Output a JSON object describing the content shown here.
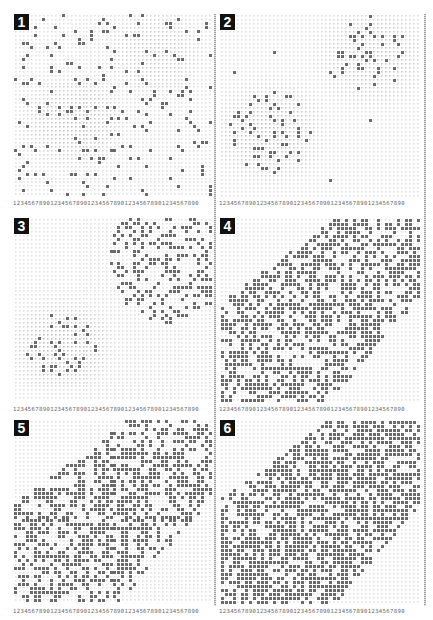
{
  "figure": {
    "grid_columns": 50,
    "column_ruler": "12345678901234567890123456789012345678901234567890",
    "colors": {
      "background": "#ffffff",
      "grid_dot": "#d8d8d8",
      "occupied_dot": "#6a6a6a",
      "blob_shade": "#cfcfcf",
      "badge_bg": "#111111",
      "badge_fg": "#ffffff"
    },
    "panels": [
      {
        "label": "1",
        "x": 14,
        "y": 14,
        "w": 198,
        "h": 186,
        "blobs": [
          {
            "cx": 0.3,
            "cy": 0.6,
            "r": 0.2,
            "shade": 0.55
          },
          {
            "cx": 0.72,
            "cy": 0.22,
            "r": 0.18,
            "shade": 0.45
          }
        ],
        "occupied": {
          "mode": "uniform",
          "density": 0.1,
          "seed": 11
        },
        "ruler_y": 200
      },
      {
        "label": "2",
        "x": 220,
        "y": 14,
        "w": 200,
        "h": 186,
        "blobs": [
          {
            "cx": 0.25,
            "cy": 0.64,
            "r": 0.22,
            "shade": 0.6
          },
          {
            "cx": 0.76,
            "cy": 0.23,
            "r": 0.22,
            "shade": 0.5
          }
        ],
        "occupied": {
          "mode": "blobs",
          "density": 0.22,
          "seed": 23,
          "stray": 0.004
        },
        "ruler_y": 200
      },
      {
        "label": "3",
        "x": 14,
        "y": 218,
        "w": 198,
        "h": 186,
        "blobs": [
          {
            "cx": 0.24,
            "cy": 0.7,
            "r": 0.2,
            "shade": 0.6
          }
        ],
        "occupied": {
          "mode": "band",
          "density": 0.34,
          "seed": 37,
          "bandCx": 0.78,
          "bandCy": 0.22,
          "bandR": 0.28,
          "blobDensity": 0.2
        },
        "ruler_y": 406
      },
      {
        "label": "4",
        "x": 220,
        "y": 218,
        "w": 200,
        "h": 186,
        "blobs": [],
        "occupied": {
          "mode": "diag",
          "density": 0.55,
          "seed": 41,
          "width": 0.3
        },
        "ruler_y": 406
      },
      {
        "label": "5",
        "x": 14,
        "y": 420,
        "w": 198,
        "h": 186,
        "blobs": [],
        "occupied": {
          "mode": "diag",
          "density": 0.48,
          "seed": 53,
          "width": 0.3
        },
        "ruler_y": 608
      },
      {
        "label": "6",
        "x": 220,
        "y": 420,
        "w": 200,
        "h": 186,
        "blobs": [],
        "occupied": {
          "mode": "diag",
          "density": 0.66,
          "seed": 67,
          "width": 0.32
        },
        "ruler_y": 608
      }
    ]
  }
}
